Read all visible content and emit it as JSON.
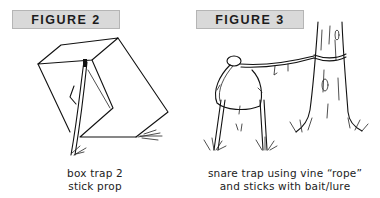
{
  "figures": [
    {
      "label": "FIGURE 2",
      "caption": [
        "box trap 2",
        "stick prop"
      ],
      "illustration": "box-trap-stick-prop"
    },
    {
      "label": "FIGURE 3",
      "caption": [
        "snare trap using vine “rope”",
        "and sticks with bait/lure"
      ],
      "illustration": "snare-trap-vine-rope"
    }
  ],
  "colors": {
    "label_background": "#d9d9d9",
    "label_border": "#b5b5b5",
    "ink": "#111111",
    "background": "#ffffff"
  }
}
